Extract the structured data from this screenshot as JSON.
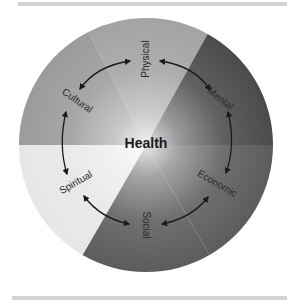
{
  "diagram": {
    "title": "Health",
    "center_label": "Health",
    "segments": [
      {
        "label": "Physical",
        "color": "#a3a3a3"
      },
      {
        "label": "Mental",
        "color": "#4b4b4b"
      },
      {
        "label": "Economic",
        "color": "#5c5c5c"
      },
      {
        "label": "Social",
        "color": "#5c5c5c"
      },
      {
        "label": "Spiritual",
        "color": "#e7e7e7"
      },
      {
        "label": "Cultural",
        "color": "#9b9b9b"
      }
    ],
    "connections": [
      [
        "Physical",
        "Mental"
      ],
      [
        "Mental",
        "Economic"
      ],
      [
        "Economic",
        "Social"
      ],
      [
        "Social",
        "Spiritual"
      ],
      [
        "Spiritual",
        "Cultural"
      ],
      [
        "Cultural",
        "Physical"
      ]
    ]
  }
}
